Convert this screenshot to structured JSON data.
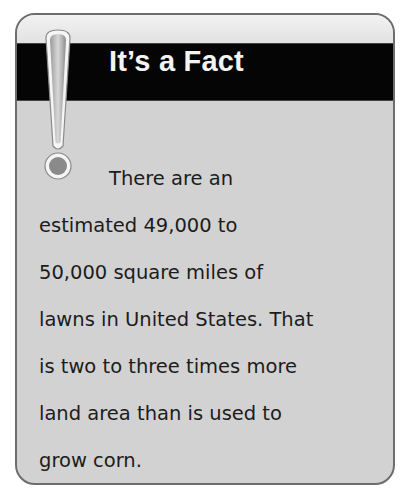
{
  "callout": {
    "title": "It’s a Fact",
    "icon": "exclamation-icon",
    "lines": [
      "There are an",
      "estimated 49,000 to",
      "50,000 square miles of",
      "lawns in United States. That",
      "is two to three times more",
      "land area than is used to",
      "grow corn."
    ]
  },
  "colors": {
    "title_band": "#050505",
    "title_text": "#f4f4f4",
    "body_background": "#d2d2d2",
    "border": "#6d6d6d",
    "icon_dot": "#8a8a8a"
  }
}
